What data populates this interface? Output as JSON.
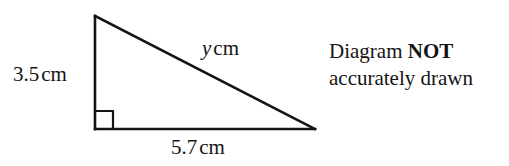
{
  "figure": {
    "type": "right-triangle-diagram",
    "stroke_color": "#141414",
    "background_color": "#ffffff",
    "vertices": {
      "apex": [
        95,
        16
      ],
      "right_angle": [
        95,
        129
      ],
      "base_right": [
        315,
        129
      ]
    },
    "right_angle_marker": {
      "size": 18,
      "present": true
    },
    "labels": {
      "vertical_side": {
        "value": "3.5",
        "unit": "cm",
        "text": "3.5 cm"
      },
      "hypotenuse": {
        "variable": "y",
        "unit": "cm",
        "text": "y cm"
      },
      "base_side": {
        "value": "5.7",
        "unit": "cm",
        "text": "5.7 cm"
      }
    }
  },
  "note": {
    "line1_plain": "Diagram ",
    "line1_strong": "NOT",
    "line2": "accurately drawn"
  }
}
